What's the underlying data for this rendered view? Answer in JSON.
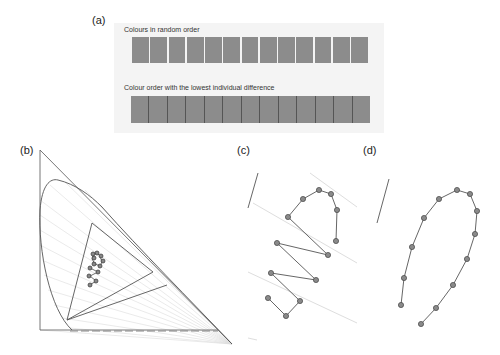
{
  "panels": {
    "a": {
      "label": "(a)",
      "caption_random": "Colours in random order",
      "caption_ordered": "Colour order with the lowest individual difference",
      "swatch_count": 13,
      "swatch_color": "#8c8c8c"
    },
    "b": {
      "label": "(b)"
    },
    "c": {
      "label": "(c)"
    },
    "d": {
      "label": "(d)"
    }
  },
  "colors": {
    "line": "#555555",
    "guide": "#d8d8d8",
    "point_fill": "#8a8a8a",
    "point_stroke": "#444444"
  },
  "geometry": {
    "c_points": [
      [
        336,
        241
      ],
      [
        337,
        210
      ],
      [
        331,
        194
      ],
      [
        319,
        190
      ],
      [
        303,
        199
      ],
      [
        288,
        217
      ],
      [
        328,
        255
      ],
      [
        277,
        243
      ],
      [
        316,
        280
      ],
      [
        271,
        273
      ],
      [
        300,
        301
      ],
      [
        286,
        316
      ],
      [
        268,
        298
      ]
    ],
    "d_points": [
      [
        401,
        305
      ],
      [
        404,
        278
      ],
      [
        412,
        247
      ],
      [
        424,
        218
      ],
      [
        439,
        199
      ],
      [
        457,
        190
      ],
      [
        470,
        194
      ],
      [
        477,
        211
      ],
      [
        475,
        234
      ],
      [
        467,
        259
      ],
      [
        453,
        285
      ],
      [
        436,
        308
      ],
      [
        421,
        324
      ]
    ]
  }
}
